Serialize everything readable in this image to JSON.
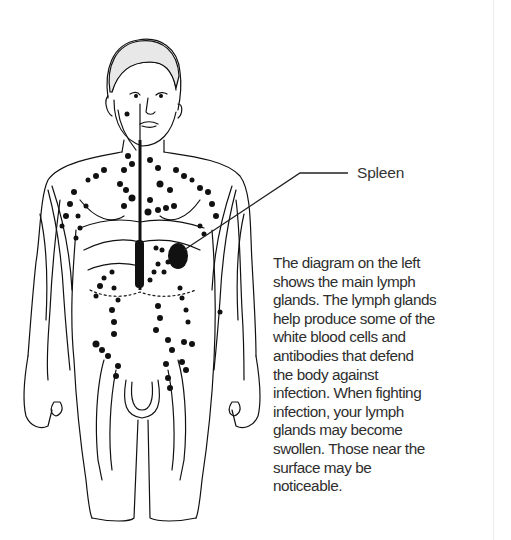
{
  "diagram": {
    "labels": [
      {
        "id": "spleen",
        "text": "Spleen"
      }
    ],
    "caption_lines": [
      "The diagram on the left",
      "shows the main lymph",
      "glands. The lymph glands",
      "help produce some of the",
      "white blood cells and",
      "antibodies that defend",
      "the body against",
      "infection. When fighting",
      "infection, your lymph",
      "glands may become",
      "swollen. Those near the",
      "surface may be",
      "noticeable."
    ],
    "colors": {
      "ink": "#111111",
      "text": "#2e2e2e",
      "background": "#ffffff"
    }
  }
}
